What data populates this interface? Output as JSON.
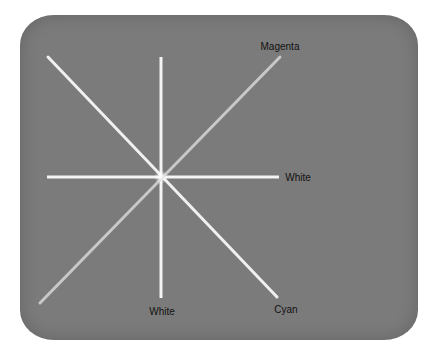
{
  "figure": {
    "background_color": "#7b7b7b",
    "line_color_bright": "#f4f4f4",
    "line_color_dim": "#c8c8c8",
    "center": {
      "x": 161,
      "y": 177
    },
    "lines": [
      {
        "name": "vertical",
        "x1": 161,
        "y1": 57,
        "x2": 161,
        "y2": 298,
        "color": "#f4f4f4"
      },
      {
        "name": "horizontal",
        "x1": 47,
        "y1": 177,
        "x2": 279,
        "y2": 177,
        "color": "#f4f4f4"
      },
      {
        "name": "diagonal-tl-br",
        "x1": 48,
        "y1": 57,
        "x2": 277,
        "y2": 297,
        "color": "#f0f0f0"
      },
      {
        "name": "diagonal-tr-bl",
        "x1": 280,
        "y1": 57,
        "x2": 40,
        "y2": 303,
        "color": "#c8c8c8"
      }
    ],
    "labels": {
      "magenta": {
        "text": "Magenta",
        "x": 280,
        "y": 47
      },
      "white_right": {
        "text": "White",
        "x": 298,
        "y": 178
      },
      "white_bottom": {
        "text": "White",
        "x": 162,
        "y": 312
      },
      "cyan": {
        "text": "Cyan",
        "x": 286,
        "y": 310
      }
    }
  }
}
